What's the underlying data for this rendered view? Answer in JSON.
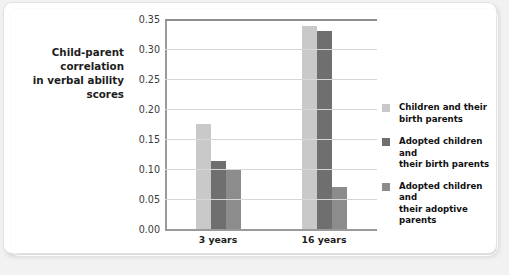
{
  "chart_data": {
    "type": "bar",
    "title": "",
    "ylabel": "Child-parent correlation in verbal ability scores",
    "xlabel": "",
    "categories": [
      "3 years",
      "16 years"
    ],
    "ylim": [
      0.0,
      0.35
    ],
    "ytick_labels": [
      "0.35",
      "0.30",
      "0.25",
      "0.20",
      "0.15",
      "0.10",
      "0.05",
      "0.00"
    ],
    "ytick_values": [
      0.35,
      0.3,
      0.25,
      0.2,
      0.15,
      0.1,
      0.05,
      0.0
    ],
    "grid": true,
    "legend_position": "right",
    "series": [
      {
        "name": "Children and their birth parents",
        "color": "#c9c9c9",
        "values": [
          0.175,
          0.339
        ]
      },
      {
        "name": "Adopted children and their birth parents",
        "color": "#6f6f6f",
        "values": [
          0.113,
          0.33
        ]
      },
      {
        "name": "Adopted children and their adoptive parents",
        "color": "#8c8c8c",
        "values": [
          0.098,
          0.07
        ]
      }
    ]
  },
  "axis": {
    "y_title_line1": "Child-parent correlation",
    "y_title_line2": "in verbal ability scores"
  },
  "legend": {
    "items": [
      {
        "label_line1": "Children and their",
        "label_line2": "birth parents"
      },
      {
        "label_line1": "Adopted children and",
        "label_line2": "their birth parents"
      },
      {
        "label_line1": "Adopted children and",
        "label_line2": "their adoptive parents"
      }
    ]
  }
}
